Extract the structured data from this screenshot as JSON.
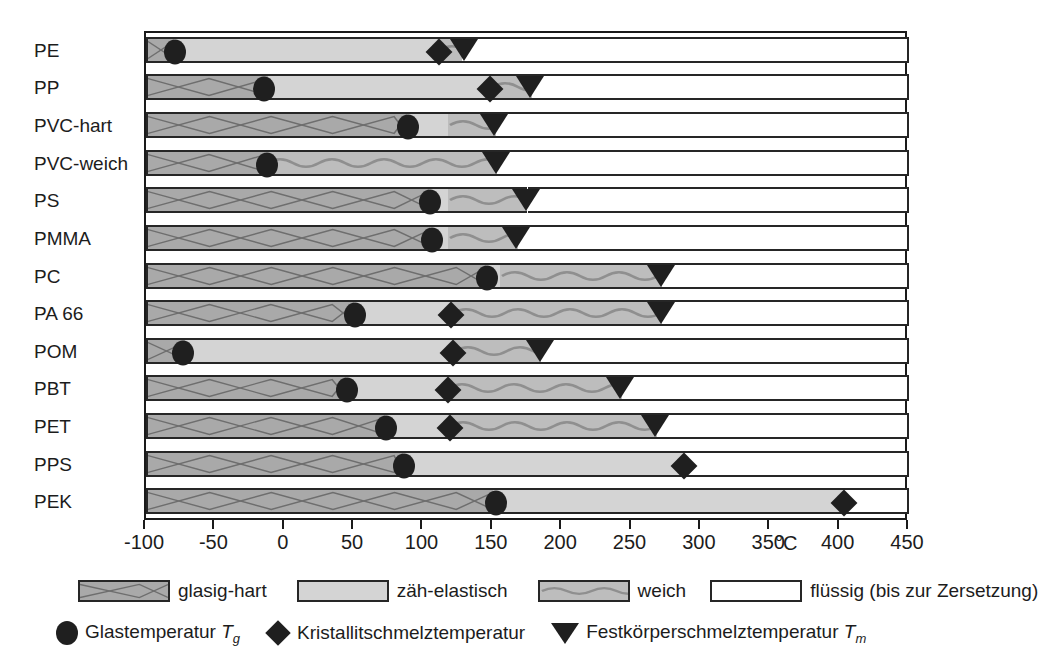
{
  "chart_data": {
    "type": "bar",
    "title": "",
    "xlabel": "°C",
    "ylabel": "",
    "xlim": [
      -100,
      450
    ],
    "xticks": [
      -100,
      -50,
      0,
      50,
      100,
      150,
      200,
      250,
      300,
      350,
      400,
      450
    ],
    "xtick_labels": [
      "-100",
      "-50",
      "0",
      "50",
      "100",
      "150",
      "200",
      "250",
      "300",
      "350",
      "400",
      "450"
    ],
    "unit": "°C",
    "grid": false,
    "legend_position": "bottom",
    "categories": [
      "PE",
      "PP",
      "PVC-hart",
      "PVC-weich",
      "PS",
      "PMMA",
      "PC",
      "PA 66",
      "POM",
      "PBT",
      "PET",
      "PPS",
      "PEK"
    ],
    "state_names": [
      "glasig-hart",
      "zäh-elastisch",
      "weich",
      "flüssig (bis zur Zersetzung)"
    ],
    "marker_names": [
      "Glastemperatur Tg",
      "Kristallitschmelztemperatur",
      "Festkörperschmelztemperatur Tm"
    ],
    "rows": [
      {
        "name": "PE",
        "glasig_end": -80,
        "zaeh_end": 110,
        "weich_end": 128,
        "tg": -79,
        "tk": 111,
        "tm": 129
      },
      {
        "name": "PP",
        "glasig_end": -12,
        "zaeh_end": 148,
        "weich_end": 178,
        "tg": -15,
        "tk": 148,
        "tm": 177
      },
      {
        "name": "PVC-hart",
        "glasig_end": 88,
        "zaeh_end": 118,
        "weich_end": 152,
        "tg": 89,
        "tk": null,
        "tm": 151
      },
      {
        "name": "PVC-weich",
        "glasig_end": -14,
        "zaeh_end": -14,
        "weich_end": 153,
        "tg": -13,
        "tk": null,
        "tm": 152
      },
      {
        "name": "PS",
        "glasig_end": 104,
        "zaeh_end": 118,
        "weich_end": 175,
        "tg": 105,
        "tk": null,
        "tm": 174
      },
      {
        "name": "PMMA",
        "glasig_end": 105,
        "zaeh_end": 118,
        "weich_end": 168,
        "tg": 106,
        "tk": null,
        "tm": 167
      },
      {
        "name": "PC",
        "glasig_end": 145,
        "zaeh_end": 155,
        "weich_end": 272,
        "tg": 146,
        "tk": null,
        "tm": 271
      },
      {
        "name": "PA 66",
        "glasig_end": 50,
        "zaeh_end": 120,
        "weich_end": 272,
        "tg": 51,
        "tk": 120,
        "tm": 271
      },
      {
        "name": "POM",
        "glasig_end": -72,
        "zaeh_end": 121,
        "weich_end": 185,
        "tg": -73,
        "tk": 121,
        "tm": 184
      },
      {
        "name": "PBT",
        "glasig_end": 44,
        "zaeh_end": 117,
        "weich_end": 243,
        "tg": 45,
        "tk": 118,
        "tm": 242
      },
      {
        "name": "PET",
        "glasig_end": 72,
        "zaeh_end": 118,
        "weich_end": 268,
        "tg": 73,
        "tk": 119,
        "tm": 267
      },
      {
        "name": "PPS",
        "glasig_end": 85,
        "zaeh_end": 288,
        "weich_end": 288,
        "tg": 86,
        "tk": 288,
        "tm": null
      },
      {
        "name": "PEK",
        "glasig_end": 150,
        "zaeh_end": 403,
        "weich_end": 403,
        "tg": 152,
        "tk": 403,
        "tm": null
      }
    ]
  },
  "legend": {
    "states": [
      {
        "label": "glasig-hart",
        "pattern": "zigzag",
        "color": "#a9a9a9"
      },
      {
        "label": "zäh-elastisch",
        "pattern": "plain",
        "color": "#d4d4d4"
      },
      {
        "label": "weich",
        "pattern": "wave",
        "color": "#bdbdbd"
      },
      {
        "label": "flüssig (bis zur Zersetzung)",
        "pattern": "empty",
        "color": "#ffffff"
      }
    ],
    "markers": [
      {
        "shape": "circle",
        "label": "Glastemperatur ",
        "symbol": "T",
        "sub": "g"
      },
      {
        "shape": "diamond",
        "label": "Kristallitschmelztemperatur",
        "symbol": "",
        "sub": ""
      },
      {
        "shape": "triangle",
        "label": "Festkörperschmelztemperatur ",
        "symbol": "T",
        "sub": "m"
      }
    ]
  },
  "colors": {
    "glasig": "#a9a9a9",
    "zaeh": "#d4d4d4",
    "weich": "#bdbdbd",
    "fluessig": "#ffffff",
    "marker": "#1f1f1f",
    "outline": "#262626"
  }
}
